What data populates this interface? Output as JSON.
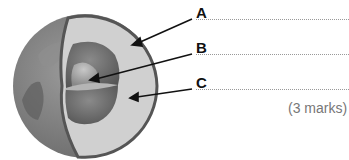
{
  "diagram": {
    "labels": [
      {
        "letter": "A",
        "answer": ""
      },
      {
        "letter": "B",
        "answer": ""
      },
      {
        "letter": "C",
        "answer": ""
      }
    ],
    "marks": "(3 marks)"
  },
  "colors": {
    "globe": "#8a8a8a",
    "land": "#6e6e6e",
    "crust_outline": "#555555",
    "mantle": "#cfcfcf",
    "outer_core": "#7a7a7a",
    "inner_core": "#a8a8a8"
  }
}
